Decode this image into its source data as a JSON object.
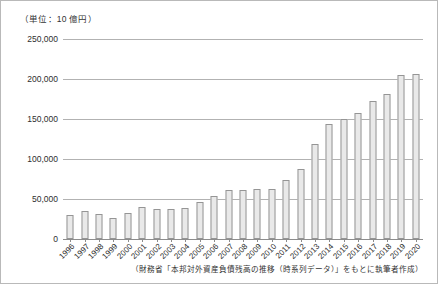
{
  "unit_label": "（単位：10 億円）",
  "source_note": "（財務省「本邦対外資産負債残高の推移（時系列データ）」をもとに執筆者作成）",
  "colors": {
    "bar_fill": "#e9e9e9",
    "bar_stroke": "#959595",
    "gridline": "#b2b2b2",
    "axis": "#8d8d8d",
    "text": "#2e2e2e",
    "frame": "#b9b9b9"
  },
  "chart_data": {
    "type": "bar",
    "title": "",
    "subtitle": "",
    "xlabel": "",
    "ylabel": "（単位：10 億円）",
    "ylim": [
      0,
      250000
    ],
    "ytick_labels": [
      "250,000",
      "200,000",
      "150,000",
      "100,000",
      "50,000",
      "0"
    ],
    "ytick_values": [
      250000,
      200000,
      150000,
      100000,
      50000,
      0
    ],
    "grid": true,
    "legend": false,
    "categories": [
      "1996",
      "1997",
      "1998",
      "1999",
      "2000",
      "2001",
      "2002",
      "2003",
      "2004",
      "2005",
      "2006",
      "2007",
      "2008",
      "2009",
      "2010",
      "2011",
      "2012",
      "2013",
      "2014",
      "2015",
      "2016",
      "2017",
      "2018",
      "2019",
      "2020"
    ],
    "values": [
      30000,
      35000,
      31000,
      26000,
      33000,
      40000,
      37000,
      37000,
      39000,
      46000,
      54000,
      61000,
      61000,
      62000,
      63000,
      74000,
      87000,
      119000,
      144000,
      150000,
      157000,
      172000,
      181000,
      205000,
      206000
    ]
  }
}
